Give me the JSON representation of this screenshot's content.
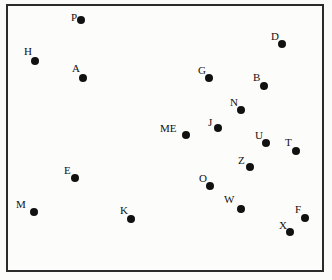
{
  "chart_data": {
    "type": "scatter",
    "title": "",
    "subtitle": "",
    "xlabel": "",
    "ylabel": "",
    "xlim": [
      0,
      332
    ],
    "ylim": [
      0,
      280
    ],
    "grid": false,
    "legend": "none",
    "axis_ticks": "none",
    "frame": {
      "x": 6,
      "y": 4,
      "width": 318,
      "height": 268,
      "border_color": "#2b2b2b",
      "border_width": 2,
      "background": "#fcfcfa"
    },
    "marker": {
      "shape": "circle",
      "color": "#111111",
      "size": 8
    },
    "label_style": {
      "color": "#111111",
      "font_size": 11
    },
    "points": [
      {
        "label": "P",
        "x": 81,
        "y": 20,
        "label_x": 71,
        "label_y": 12
      },
      {
        "label": "D",
        "x": 282,
        "y": 44,
        "label_x": 271,
        "label_y": 31
      },
      {
        "label": "H",
        "x": 35,
        "y": 61,
        "label_x": 24,
        "label_y": 46
      },
      {
        "label": "A",
        "x": 83,
        "y": 78,
        "label_x": 72,
        "label_y": 63
      },
      {
        "label": "G",
        "x": 209,
        "y": 78,
        "label_x": 198,
        "label_y": 65
      },
      {
        "label": "B",
        "x": 264,
        "y": 86,
        "label_x": 253,
        "label_y": 72
      },
      {
        "label": "N",
        "x": 241,
        "y": 110,
        "label_x": 230,
        "label_y": 97
      },
      {
        "label": "J",
        "x": 218,
        "y": 128,
        "label_x": 208,
        "label_y": 117
      },
      {
        "label": "ME",
        "x": 186,
        "y": 135,
        "label_x": 160,
        "label_y": 123
      },
      {
        "label": "U",
        "x": 266,
        "y": 143,
        "label_x": 255,
        "label_y": 130
      },
      {
        "label": "T",
        "x": 296,
        "y": 151,
        "label_x": 285,
        "label_y": 137
      },
      {
        "label": "Z",
        "x": 250,
        "y": 167,
        "label_x": 238,
        "label_y": 155
      },
      {
        "label": "E",
        "x": 75,
        "y": 178,
        "label_x": 64,
        "label_y": 165
      },
      {
        "label": "O",
        "x": 210,
        "y": 186,
        "label_x": 199,
        "label_y": 173
      },
      {
        "label": "W",
        "x": 241,
        "y": 209,
        "label_x": 224,
        "label_y": 194
      },
      {
        "label": "M",
        "x": 34,
        "y": 212,
        "label_x": 16,
        "label_y": 199
      },
      {
        "label": "K",
        "x": 131,
        "y": 219,
        "label_x": 120,
        "label_y": 205
      },
      {
        "label": "F",
        "x": 305,
        "y": 218,
        "label_x": 295,
        "label_y": 204
      },
      {
        "label": "X",
        "x": 290,
        "y": 232,
        "label_x": 279,
        "label_y": 220
      }
    ]
  }
}
